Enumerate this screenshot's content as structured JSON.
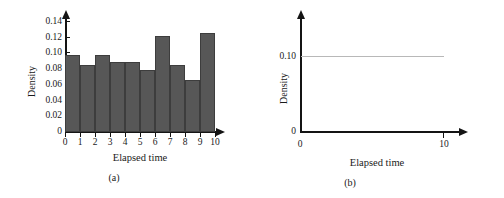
{
  "figure": {
    "panels": [
      {
        "caption": "(a)",
        "xlabel": "Elapsed time",
        "ylabel": "Density"
      },
      {
        "caption": "(b)",
        "xlabel": "Elapsed time",
        "ylabel": "Density"
      }
    ]
  },
  "chart_data": [
    {
      "type": "bar",
      "title": "",
      "subtitle": "",
      "panel": "(a)",
      "xlabel": "Elapsed time",
      "ylabel": "Density",
      "categories": [
        "0-1",
        "1-2",
        "2-3",
        "3-4",
        "4-5",
        "5-6",
        "6-7",
        "7-8",
        "8-9",
        "9-10"
      ],
      "bin_edges": [
        0,
        1,
        2,
        3,
        4,
        5,
        6,
        7,
        8,
        9,
        10
      ],
      "values": [
        0.102,
        0.088,
        0.102,
        0.092,
        0.092,
        0.082,
        0.127,
        0.088,
        0.068,
        0.131
      ],
      "x_ticklabels": [
        "0",
        "1",
        "2",
        "3",
        "4",
        "5",
        "6",
        "7",
        "8",
        "9",
        "10"
      ],
      "y_ticklabels": [
        "0",
        "0.02",
        "0.04",
        "0.06",
        "0.08",
        "0.10",
        "0.12",
        "0.14"
      ],
      "y_tickvalues": [
        0,
        0.02,
        0.04,
        0.06,
        0.08,
        0.1,
        0.12,
        0.14
      ],
      "xlim": [
        0,
        10
      ],
      "ylim": [
        0,
        0.145
      ],
      "grid": false,
      "legend": "none",
      "bar_color": "#575757",
      "bar_edge_color": "#3d3d3d",
      "axis_color": "#141414"
    },
    {
      "type": "line",
      "title": "",
      "subtitle": "",
      "panel": "(b)",
      "xlabel": "Elapsed time",
      "ylabel": "Density",
      "x": [
        0,
        10
      ],
      "values": [
        0.1,
        0.1
      ],
      "series": [
        {
          "name": "uniform density",
          "values": [
            0.1,
            0.1
          ]
        }
      ],
      "x_ticklabels": [
        "0",
        "10"
      ],
      "x_tickvalues": [
        0,
        10
      ],
      "y_ticklabels": [
        "0",
        "0.10"
      ],
      "y_tickvalues": [
        0,
        0.1
      ],
      "xlim": [
        0,
        10
      ],
      "ylim": [
        0,
        0.145
      ],
      "grid": false,
      "legend": "none",
      "line_color": "#b8b8b8",
      "axis_color": "#141414"
    }
  ]
}
